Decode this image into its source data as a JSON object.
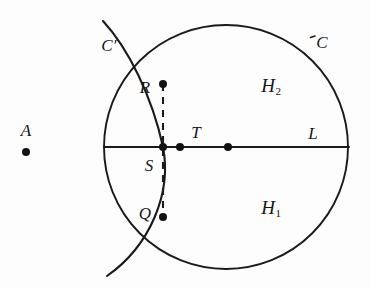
{
  "figure": {
    "background_color": "#fdfdfd",
    "stroke_color": "#1a1a1a",
    "canvas": {
      "width": 370,
      "height": 287
    }
  },
  "labels": [
    {
      "id": "A",
      "text": "A",
      "x": 26,
      "y": 130,
      "kind": "plain"
    },
    {
      "id": "Cprime",
      "text": "C′",
      "x": 109,
      "y": 45,
      "kind": "prime"
    },
    {
      "id": "C",
      "text": "C",
      "x": 322,
      "y": 42,
      "kind": "plain"
    },
    {
      "id": "H2",
      "text": "H",
      "sub": "2",
      "x": 271,
      "y": 85,
      "kind": "sub"
    },
    {
      "id": "H1",
      "text": "H",
      "sub": "1",
      "x": 271,
      "y": 207,
      "kind": "sub"
    },
    {
      "id": "R",
      "text": "R",
      "x": 145,
      "y": 87,
      "kind": "plain"
    },
    {
      "id": "T",
      "text": "T",
      "x": 196,
      "y": 132,
      "kind": "plain"
    },
    {
      "id": "L",
      "text": "L",
      "x": 313,
      "y": 133,
      "kind": "plain"
    },
    {
      "id": "S",
      "text": "S",
      "x": 149,
      "y": 165,
      "kind": "plain"
    },
    {
      "id": "Q",
      "text": "Q",
      "x": 145,
      "y": 213,
      "kind": "plain"
    }
  ],
  "points": [
    {
      "id": "A",
      "x": 26,
      "y": 152,
      "r": 4.0
    },
    {
      "id": "R",
      "x": 163,
      "y": 84,
      "r": 4.0
    },
    {
      "id": "S",
      "x": 163,
      "y": 147,
      "r": 4.0
    },
    {
      "id": "T",
      "x": 180,
      "y": 147,
      "r": 4.0
    },
    {
      "id": "center",
      "x": 228,
      "y": 147,
      "r": 4.0
    },
    {
      "id": "Q",
      "x": 163,
      "y": 217,
      "r": 4.0
    }
  ],
  "circle_C": {
    "cx": 226,
    "cy": 147,
    "r": 122
  },
  "arc_C_prime": {
    "path": "M 103 21 C 128 48 152 96 163 147 C 172 193 150 246 107 276"
  },
  "line_L": {
    "x1": 104,
    "y1": 147,
    "x2": 349,
    "y2": 147
  },
  "dashed_chord": {
    "x1": 163,
    "y1": 84,
    "x2": 163,
    "y2": 217
  },
  "c_tick": {
    "x1": 311,
    "y1": 37,
    "x2": 315,
    "y2": 36
  }
}
